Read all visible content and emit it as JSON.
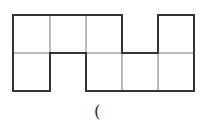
{
  "diagram": {
    "type": "grid-net",
    "columns": 5,
    "rows": 2,
    "cell_width": 36,
    "cell_height": 38,
    "origin": [
      13,
      15
    ],
    "filled_cells": {
      "row_0": [
        0,
        1,
        2,
        4
      ],
      "row_1": [
        0,
        2,
        3,
        4
      ]
    },
    "colors": {
      "outline": "#333333",
      "inner_line": "#777777",
      "background": "#ffffff"
    }
  },
  "caption": {
    "text": "("
  }
}
